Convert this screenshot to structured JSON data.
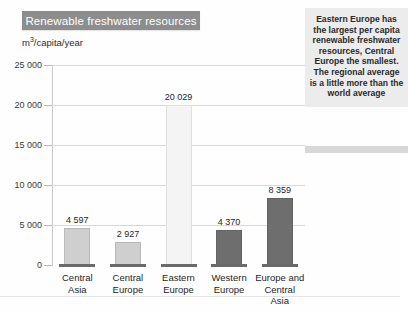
{
  "header": {
    "title": "Renewable freshwater resources",
    "unit_label": "m3/capita/year",
    "unit_prefix": "m",
    "unit_exponent": "3",
    "unit_suffix": "/capita/year"
  },
  "side_note": {
    "text": "Eastern Europe has the largest per capita renewable freshwater resources, Central Europe the smallest. The regional average is a little more than the world average"
  },
  "colors": {
    "title_bar": "#8d8d8d",
    "title_text": "#ffffff",
    "gridline": "#d8d8d8",
    "bar_light": "#cfcfcf",
    "bar_lightest": "#f2f2f2",
    "bar_dark": "#6e6e6e",
    "bar_base": "#6a6a6a",
    "note_background": "#ececec"
  },
  "chart_data": {
    "type": "bar",
    "title": "Renewable freshwater resources",
    "xlabel": "",
    "ylabel": "m3/capita/year",
    "ylim": [
      0,
      25000
    ],
    "yticks": [
      0,
      5000,
      10000,
      15000,
      20000,
      25000
    ],
    "ytick_labels": [
      "0",
      "5 000",
      "10 000",
      "15 000",
      "20 000",
      "25 000"
    ],
    "grid": true,
    "legend": "none",
    "categories": [
      "Central Asia",
      "Central Europe",
      "Eastern Europe",
      "Western Europe",
      "Europe and Central Asia"
    ],
    "category_lines": [
      [
        "Central",
        "Asia"
      ],
      [
        "Central",
        "Europe"
      ],
      [
        "Eastern",
        "Europe"
      ],
      [
        "Western",
        "Europe"
      ],
      [
        "Europe and",
        "Central Asia"
      ]
    ],
    "values": [
      4597,
      2927,
      20029,
      4370,
      8359
    ],
    "value_labels": [
      "4 597",
      "2 927",
      "20 029",
      "4 370",
      "8 359"
    ],
    "bar_colors": [
      "#cfcfcf",
      "#cfcfcf",
      "#f4f4f4",
      "#6e6e6e",
      "#6e6e6e"
    ]
  }
}
